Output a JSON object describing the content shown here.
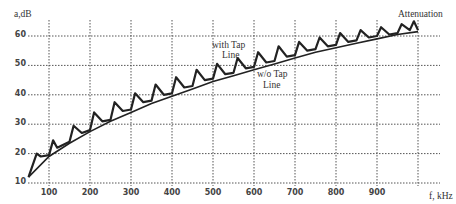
{
  "chart_data": {
    "type": "line",
    "title": "",
    "xlabel": "f, kHz",
    "ylabel": "a,dB",
    "xlim": [
      50,
      1000
    ],
    "ylim": [
      10,
      65
    ],
    "grid": true,
    "x_ticks": [
      100,
      200,
      300,
      400,
      500,
      600,
      700,
      800,
      900
    ],
    "y_ticks": [
      10,
      20,
      30,
      40,
      50,
      60
    ],
    "annotations": [
      "with Tap Line",
      "w/o Tap Line",
      "Attenuation"
    ],
    "series": [
      {
        "name": "w/o Tap Line",
        "x": [
          50,
          100,
          150,
          200,
          250,
          300,
          350,
          400,
          450,
          500,
          550,
          600,
          650,
          700,
          750,
          800,
          850,
          900,
          950,
          1000
        ],
        "values": [
          12,
          19,
          23.5,
          27.5,
          31,
          34,
          37,
          39.5,
          42,
          44.5,
          46.5,
          48.5,
          50.5,
          52.5,
          54.5,
          56,
          57.5,
          59,
          60.5,
          61.5
        ]
      },
      {
        "name": "with Tap Line",
        "x": [
          50,
          70,
          80,
          100,
          110,
          120,
          150,
          160,
          180,
          200,
          210,
          230,
          250,
          260,
          280,
          300,
          310,
          330,
          350,
          360,
          380,
          400,
          410,
          430,
          450,
          460,
          480,
          500,
          510,
          530,
          550,
          560,
          580,
          600,
          610,
          630,
          650,
          660,
          680,
          700,
          710,
          730,
          750,
          760,
          780,
          800,
          810,
          830,
          850,
          860,
          880,
          900,
          910,
          930,
          950,
          960,
          980,
          990,
          1000
        ],
        "values": [
          12,
          20,
          19,
          19.5,
          24.5,
          22,
          24,
          29.5,
          27,
          28,
          34,
          31,
          31.5,
          37.5,
          34.5,
          35,
          40.5,
          37.5,
          38,
          43.5,
          40,
          40.5,
          46,
          42.5,
          43,
          48.5,
          45,
          45.5,
          50.5,
          47,
          47.5,
          52.5,
          49,
          49.5,
          54.5,
          51,
          51.5,
          56.5,
          53,
          53.5,
          58,
          55,
          55.5,
          59.5,
          56.5,
          57,
          61,
          58,
          58.5,
          62,
          59.5,
          60,
          63,
          60.5,
          61,
          64,
          62,
          65,
          62
        ]
      }
    ]
  }
}
